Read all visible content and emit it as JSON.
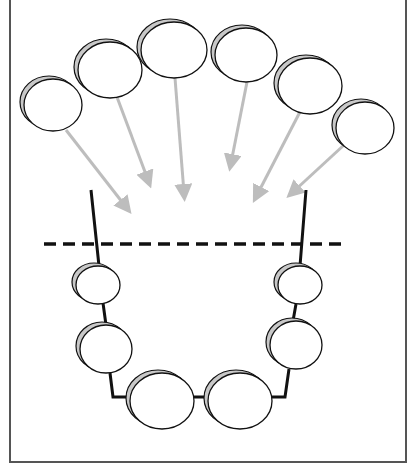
{
  "diagram": {
    "type": "schematic",
    "colors": {
      "outline": "#111111",
      "shadow": "#c8c8c8",
      "arrow": "#bdbdbd",
      "border": "#555555",
      "dashed_line": "#111111"
    },
    "upper_ellipses": [
      {
        "cx": 53,
        "cy": 105,
        "rx": 29,
        "ry": 26
      },
      {
        "cx": 110,
        "cy": 70,
        "rx": 32,
        "ry": 28
      },
      {
        "cx": 174,
        "cy": 50,
        "rx": 33,
        "ry": 28
      },
      {
        "cx": 246,
        "cy": 55,
        "rx": 31,
        "ry": 27
      },
      {
        "cx": 310,
        "cy": 86,
        "rx": 32,
        "ry": 28
      },
      {
        "cx": 365,
        "cy": 128,
        "rx": 29,
        "ry": 26
      }
    ],
    "arrows": [
      {
        "x1": 66,
        "y1": 130,
        "x2": 126,
        "y2": 207
      },
      {
        "x1": 117,
        "y1": 97,
        "x2": 148,
        "y2": 180
      },
      {
        "x1": 175,
        "y1": 78,
        "x2": 184,
        "y2": 193
      },
      {
        "x1": 247,
        "y1": 82,
        "x2": 231,
        "y2": 163
      },
      {
        "x1": 302,
        "y1": 108,
        "x2": 257,
        "y2": 195
      },
      {
        "x1": 344,
        "y1": 145,
        "x2": 293,
        "y2": 192
      }
    ],
    "lower_ellipses": [
      {
        "cx": 98,
        "cy": 285,
        "rx": 22,
        "ry": 19
      },
      {
        "cx": 106,
        "cy": 349,
        "rx": 26,
        "ry": 24
      },
      {
        "cx": 162,
        "cy": 401,
        "rx": 32,
        "ry": 28
      },
      {
        "cx": 240,
        "cy": 401,
        "rx": 32,
        "ry": 28
      },
      {
        "cx": 296,
        "cy": 345,
        "rx": 26,
        "ry": 24
      },
      {
        "cx": 300,
        "cy": 285,
        "rx": 22,
        "ry": 19
      }
    ],
    "chain_path": "M 91 190 L 99 266 M 103 303 L 106 325 M 110 373 L 113 397 L 130 397 M 194 397 L 208 397 M 272 397 L 285 397 L 289 369 M 293 321 L 296 304 M 300 266 L 306 190",
    "dashed_line": {
      "x1": 44,
      "y1": 244,
      "x2": 342,
      "y2": 244
    }
  }
}
